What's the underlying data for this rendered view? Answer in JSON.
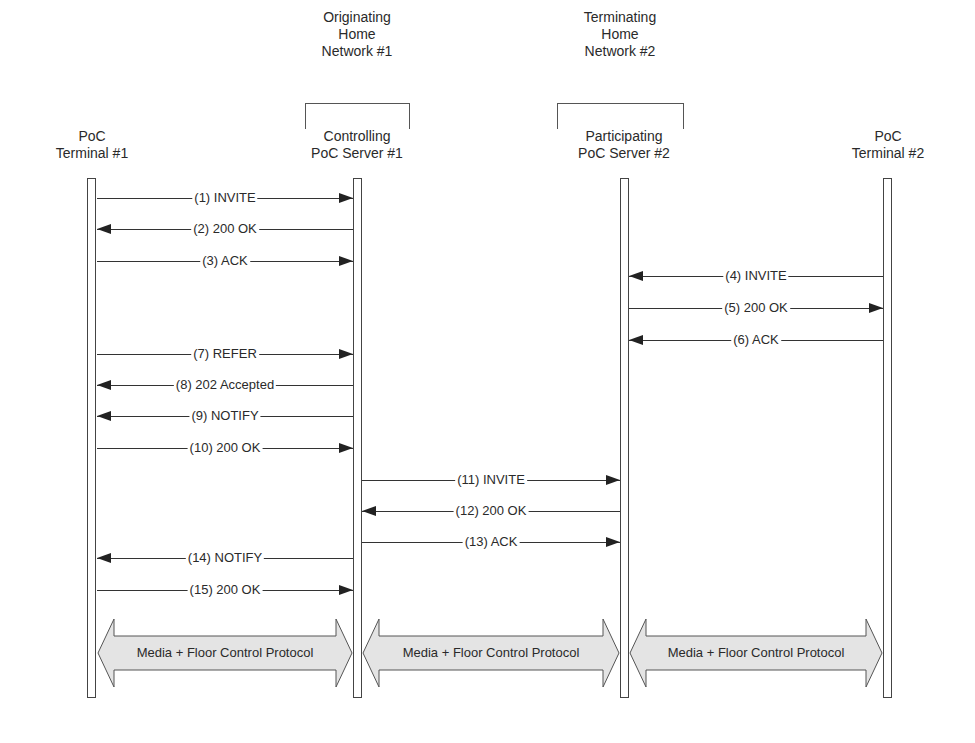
{
  "networks": [
    {
      "label_lines": [
        "Originating",
        "Home",
        "Network #1"
      ]
    },
    {
      "label_lines": [
        "Terminating",
        "Home",
        "Network #2"
      ]
    }
  ],
  "entities": [
    {
      "label_lines": [
        "PoC",
        "Terminal #1"
      ]
    },
    {
      "label_lines": [
        "Controlling",
        "PoC Server #1"
      ]
    },
    {
      "label_lines": [
        "Participating",
        "PoC Server #2"
      ]
    },
    {
      "label_lines": [
        "PoC",
        "Terminal #2"
      ]
    }
  ],
  "messages": [
    {
      "label": "(1) INVITE",
      "from": 0,
      "to": 1
    },
    {
      "label": "(2) 200 OK",
      "from": 1,
      "to": 0
    },
    {
      "label": "(3) ACK",
      "from": 0,
      "to": 1
    },
    {
      "label": "(4) INVITE",
      "from": 3,
      "to": 2
    },
    {
      "label": "(5) 200 OK",
      "from": 2,
      "to": 3
    },
    {
      "label": "(6) ACK",
      "from": 3,
      "to": 2
    },
    {
      "label": "(7) REFER",
      "from": 0,
      "to": 1
    },
    {
      "label": "(8) 202 Accepted",
      "from": 1,
      "to": 0
    },
    {
      "label": "(9) NOTIFY",
      "from": 1,
      "to": 0
    },
    {
      "label": "(10) 200 OK",
      "from": 0,
      "to": 1
    },
    {
      "label": "(11) INVITE",
      "from": 1,
      "to": 2
    },
    {
      "label": "(12) 200 OK",
      "from": 2,
      "to": 1
    },
    {
      "label": "(13) ACK",
      "from": 1,
      "to": 2
    },
    {
      "label": "(14) NOTIFY",
      "from": 1,
      "to": 0
    },
    {
      "label": "(15) 200 OK",
      "from": 0,
      "to": 1
    }
  ],
  "media_flows": [
    {
      "label": "Media + Floor Control Protocol",
      "between": [
        0,
        1
      ]
    },
    {
      "label": "Media + Floor Control Protocol",
      "between": [
        1,
        2
      ]
    },
    {
      "label": "Media + Floor Control Protocol",
      "between": [
        2,
        3
      ]
    }
  ],
  "colors": {
    "media_fill": "#e4e4e4",
    "line": "#333333"
  }
}
